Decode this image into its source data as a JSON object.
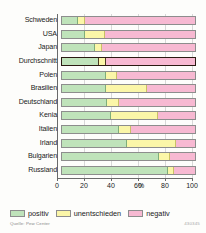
{
  "chart_data": {
    "type": "bar",
    "orientation": "horizontal",
    "stacked": true,
    "stack_total": 100,
    "title": "",
    "xlabel": "%",
    "ylabel": "",
    "xlim": [
      0,
      100
    ],
    "xticks": [
      0,
      20,
      40,
      60,
      80,
      100
    ],
    "xtick_labels": [
      "0",
      "20",
      "40",
      "60",
      "80",
      "100"
    ],
    "grid": true,
    "legend_position": "bottom",
    "categories": [
      "Schweden",
      "USA",
      "Japan",
      "Durchschnitt",
      "Polen",
      "Brasilien",
      "Deutschland",
      "Kenia",
      "Italien",
      "Irland",
      "Bulgarien",
      "Russland"
    ],
    "highlighted_category": "Durchschnitt",
    "series": [
      {
        "name": "positiv",
        "color": "#bfe3ba",
        "values": [
          12,
          17,
          25,
          28,
          33,
          33,
          34,
          37,
          43,
          49,
          73,
          80
        ]
      },
      {
        "name": "unentschieden",
        "color": "#fbf6a8",
        "values": [
          5,
          15,
          5,
          5,
          8,
          31,
          9,
          35,
          9,
          37,
          8,
          4
        ]
      },
      {
        "name": "negativ",
        "color": "#f7b9d2",
        "values": [
          83,
          68,
          70,
          67,
          59,
          36,
          57,
          28,
          48,
          14,
          19,
          16
        ]
      }
    ],
    "percent_sign": "%",
    "source": "Quelle: Pew Center",
    "image_id": "430345"
  },
  "legend": {
    "items": [
      {
        "label": "positiv"
      },
      {
        "label": "unentschieden"
      },
      {
        "label": "negativ"
      }
    ]
  }
}
